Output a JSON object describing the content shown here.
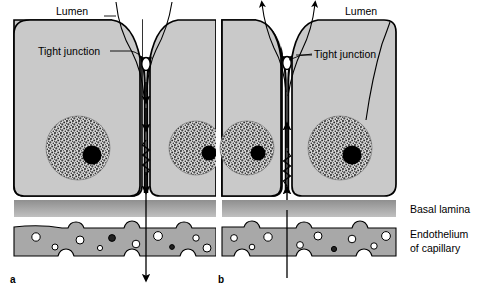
{
  "figure": {
    "type": "biological-diagram",
    "panels": [
      {
        "letter": "a",
        "lumen_label": "Lumen",
        "tight_junction_label": "Tight junction",
        "direction": "absorption",
        "flow_description": "arrows point downward from lumen through intercellular cleft and cell, exiting below the capillary endothelium"
      },
      {
        "letter": "b",
        "lumen_label": "Lumen",
        "tight_junction_label": "Tight junction",
        "direction": "secretion",
        "flow_description": "arrows point upward from below the capillary endothelium through the cell and intercellular cleft into the lumen"
      }
    ],
    "layer_labels": {
      "basal_lamina": "Basal lamina",
      "endothelium_line1": "Endothelium",
      "endothelium_line2": "of capillary"
    },
    "colors": {
      "cytoplasm": "#c9c9c9",
      "outline": "#000000",
      "basal_lamina": "#9a9a9a",
      "endothelium": "#a8a8a8",
      "nucleus_stipple": "#555555",
      "nucleolus": "#000000",
      "background": "#ffffff"
    }
  }
}
